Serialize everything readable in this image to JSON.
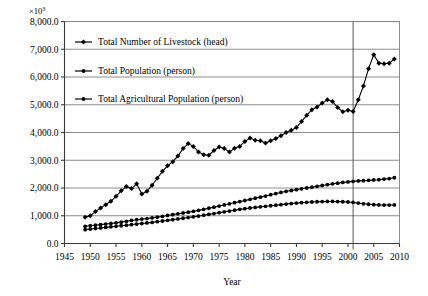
{
  "chart_data": {
    "type": "line",
    "title": "",
    "xlabel": "Year",
    "ylabel": "",
    "unit_label": "×10",
    "unit_exponent": "3",
    "xlim": [
      1945,
      2010
    ],
    "ylim": [
      0,
      8000
    ],
    "xticks": [
      1945,
      1950,
      1955,
      1960,
      1965,
      1970,
      1975,
      1980,
      1985,
      1990,
      1995,
      2000,
      2005,
      2010
    ],
    "xtick_labels": [
      "1945",
      "1950",
      "1955",
      "1960",
      "1965",
      "1970",
      "1975",
      "1980",
      "1985",
      "1990",
      "1995",
      "2000",
      "2005",
      "2010"
    ],
    "yticks": [
      0,
      1000,
      2000,
      3000,
      4000,
      5000,
      6000,
      7000,
      8000
    ],
    "ytick_labels": [
      "0.0",
      "1,000.0",
      "2,000.0",
      "3,000.0",
      "4,000.0",
      "5,000.0",
      "6,000.0",
      "7,000.0",
      "8,000.0"
    ],
    "grid": true,
    "grid_axis": "y",
    "legend_position": "upper-left-inside",
    "annotations": [
      {
        "name": "reference-vertical-line",
        "type": "vline",
        "x": 2001
      }
    ],
    "series": [
      {
        "name": "Total Number of Livestock (head)",
        "marker": "diamond",
        "color": "#000000",
        "x": [
          1949,
          1950,
          1951,
          1952,
          1953,
          1954,
          1955,
          1956,
          1957,
          1958,
          1959,
          1960,
          1961,
          1962,
          1963,
          1964,
          1965,
          1966,
          1967,
          1968,
          1969,
          1970,
          1971,
          1972,
          1973,
          1974,
          1975,
          1976,
          1977,
          1978,
          1979,
          1980,
          1981,
          1982,
          1983,
          1984,
          1985,
          1986,
          1987,
          1988,
          1989,
          1990,
          1991,
          1992,
          1993,
          1994,
          1995,
          1996,
          1997,
          1998,
          1999,
          2000,
          2001,
          2002,
          2003,
          2004,
          2005,
          2006,
          2007,
          2008,
          2009
        ],
        "values": [
          950,
          1000,
          1150,
          1280,
          1400,
          1520,
          1700,
          1900,
          2050,
          1980,
          2150,
          1780,
          1880,
          2100,
          2350,
          2600,
          2800,
          2950,
          3150,
          3420,
          3600,
          3500,
          3300,
          3200,
          3180,
          3350,
          3480,
          3420,
          3300,
          3430,
          3500,
          3680,
          3800,
          3720,
          3700,
          3620,
          3700,
          3780,
          3880,
          4000,
          4080,
          4180,
          4400,
          4620,
          4820,
          4920,
          5060,
          5180,
          5120,
          4900,
          4750,
          4800,
          4760,
          5180,
          5680,
          6300,
          6800,
          6500,
          6480,
          6500,
          6650
        ]
      },
      {
        "name": "Total Population (person)",
        "marker": "circle",
        "color": "#000000",
        "x": [
          1949,
          1950,
          1951,
          1952,
          1953,
          1954,
          1955,
          1956,
          1957,
          1958,
          1959,
          1960,
          1961,
          1962,
          1963,
          1964,
          1965,
          1966,
          1967,
          1968,
          1969,
          1970,
          1971,
          1972,
          1973,
          1974,
          1975,
          1976,
          1977,
          1978,
          1979,
          1980,
          1981,
          1982,
          1983,
          1984,
          1985,
          1986,
          1987,
          1988,
          1989,
          1990,
          1991,
          1992,
          1993,
          1994,
          1995,
          1996,
          1997,
          1998,
          1999,
          2000,
          2001,
          2002,
          2003,
          2004,
          2005,
          2006,
          2007,
          2008,
          2009
        ],
        "values": [
          620,
          640,
          660,
          680,
          700,
          720,
          745,
          770,
          800,
          830,
          855,
          880,
          900,
          925,
          950,
          980,
          1010,
          1040,
          1070,
          1100,
          1130,
          1160,
          1195,
          1230,
          1270,
          1310,
          1350,
          1390,
          1430,
          1470,
          1510,
          1550,
          1590,
          1630,
          1670,
          1710,
          1760,
          1800,
          1840,
          1880,
          1910,
          1940,
          1970,
          2000,
          2030,
          2060,
          2090,
          2120,
          2150,
          2175,
          2200,
          2220,
          2240,
          2255,
          2265,
          2275,
          2290,
          2300,
          2320,
          2340,
          2370
        ]
      },
      {
        "name": "Total Agricultural Population (person)",
        "marker": "circle",
        "color": "#000000",
        "x": [
          1949,
          1950,
          1951,
          1952,
          1953,
          1954,
          1955,
          1956,
          1957,
          1958,
          1959,
          1960,
          1961,
          1962,
          1963,
          1964,
          1965,
          1966,
          1967,
          1968,
          1969,
          1970,
          1971,
          1972,
          1973,
          1974,
          1975,
          1976,
          1977,
          1978,
          1979,
          1980,
          1981,
          1982,
          1983,
          1984,
          1985,
          1986,
          1987,
          1988,
          1989,
          1990,
          1991,
          1992,
          1993,
          1994,
          1995,
          1996,
          1997,
          1998,
          1999,
          2000,
          2001,
          2002,
          2003,
          2004,
          2005,
          2006,
          2007,
          2008,
          2009
        ],
        "values": [
          500,
          520,
          540,
          560,
          580,
          600,
          620,
          640,
          660,
          680,
          700,
          720,
          740,
          760,
          785,
          810,
          835,
          860,
          885,
          910,
          935,
          960,
          990,
          1020,
          1050,
          1080,
          1110,
          1140,
          1170,
          1200,
          1230,
          1255,
          1280,
          1300,
          1320,
          1340,
          1360,
          1380,
          1400,
          1420,
          1440,
          1455,
          1470,
          1485,
          1495,
          1505,
          1510,
          1515,
          1515,
          1510,
          1505,
          1495,
          1480,
          1455,
          1430,
          1415,
          1400,
          1390,
          1385,
          1385,
          1390
        ]
      }
    ],
    "legend": [
      {
        "label": "Total Number of Livestock (head)",
        "marker": "diamond"
      },
      {
        "label": "Total Population (person)",
        "marker": "circle"
      },
      {
        "label": "Total Agricultural Population (person)",
        "marker": "circle"
      }
    ]
  }
}
